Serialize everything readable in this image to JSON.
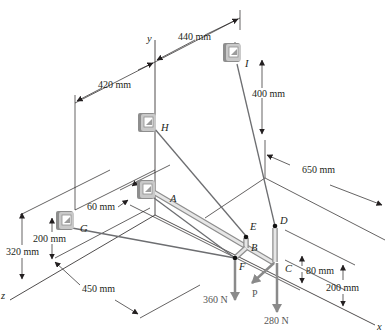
{
  "figure": {
    "axes": {
      "x": "x",
      "y": "y",
      "z": "z"
    },
    "points": {
      "A": "A",
      "B": "B",
      "C": "C",
      "D": "D",
      "E": "E",
      "F": "F",
      "G": "G",
      "H": "H",
      "I": "I"
    },
    "dimensions": {
      "d440": "440 mm",
      "d420": "420 mm",
      "d400": "400 mm",
      "d650": "650 mm",
      "d60": "60 mm",
      "d200_left": "200 mm",
      "d320": "320 mm",
      "d450": "450 mm",
      "d80": "80 mm",
      "d200_right": "200 mm"
    },
    "forces": {
      "f360": "360 N",
      "fP": "P",
      "f280": "280 N"
    },
    "colors": {
      "bracket_face": "#c9c9c9",
      "bracket_shadow": "#8e8e8e",
      "cable": "#6d6e71",
      "force_arrow": "#8a8a8a",
      "line": "#231f20"
    }
  }
}
